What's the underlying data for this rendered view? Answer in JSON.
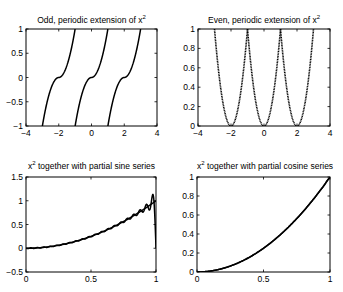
{
  "figure": {
    "background": "#ffffff",
    "line_color": "#000000"
  },
  "chart_data": [
    {
      "type": "line",
      "title": "Odd, periodic extension of x^2",
      "title_text": "Odd, periodic extension of x",
      "title_sup": "2",
      "xlabel": "",
      "ylabel": "",
      "xlim": [
        -4,
        4
      ],
      "ylim": [
        -1,
        1
      ],
      "xticks": [
        "-4",
        "-2",
        "0",
        "2",
        "4"
      ],
      "yticks": [
        "-1",
        "-0.5",
        "0",
        "0.5",
        "1"
      ],
      "grid": false,
      "series": [
        {
          "name": "odd extension",
          "style": "solid",
          "function": "sign(t)*t^2, t = x - 2*round(x/2)",
          "x_range": [
            -3,
            3
          ]
        }
      ]
    },
    {
      "type": "line",
      "title": "Even, periodic extension of x^2",
      "title_text": "Even, periodic extension of x",
      "title_sup": "2",
      "xlabel": "",
      "ylabel": "",
      "xlim": [
        -4,
        4
      ],
      "ylim": [
        0,
        1
      ],
      "xticks": [
        "-4",
        "-2",
        "0",
        "2",
        "4"
      ],
      "yticks": [
        "0",
        "0.2",
        "0.4",
        "0.6",
        "0.8",
        "1"
      ],
      "grid": false,
      "series": [
        {
          "name": "even extension",
          "style": "dotted",
          "function": "t^2, t = x - 2*round(x/2)",
          "x_range": [
            -3,
            3
          ]
        }
      ]
    },
    {
      "type": "line",
      "title": "x^2 together with partial sine series",
      "title_text": " together with partial sine series",
      "title_prefix": "x",
      "title_sup": "2",
      "xlabel": "",
      "ylabel": "",
      "xlim": [
        0,
        1
      ],
      "ylim": [
        -0.5,
        1.5
      ],
      "xticks": [
        "0",
        "0.5",
        "1"
      ],
      "yticks": [
        "-0.5",
        "0",
        "0.5",
        "1",
        "1.5"
      ],
      "grid": false,
      "series": [
        {
          "name": "x^2",
          "style": "solid",
          "x": [
            0,
            0.25,
            0.5,
            0.75,
            1
          ],
          "values": [
            0,
            0.0625,
            0.25,
            0.5625,
            1
          ]
        },
        {
          "name": "partial sine series",
          "style": "solid",
          "note": "oscillates near x=1 (Gibbs), peak ~1.1, drops to 0 at x=1"
        }
      ]
    },
    {
      "type": "line",
      "title": "x^2 together with partial cosine series",
      "title_text": " together with partial cosine series",
      "title_prefix": "x",
      "title_sup": "2",
      "xlabel": "",
      "ylabel": "",
      "xlim": [
        0,
        1
      ],
      "ylim": [
        0,
        1
      ],
      "xticks": [
        "0",
        "0.5",
        "1"
      ],
      "yticks": [
        "0",
        "0.2",
        "0.4",
        "0.6",
        "0.8",
        "1"
      ],
      "grid": false,
      "series": [
        {
          "name": "x^2",
          "style": "solid",
          "x": [
            0,
            0.25,
            0.5,
            0.75,
            1
          ],
          "values": [
            0,
            0.0625,
            0.25,
            0.5625,
            1
          ]
        },
        {
          "name": "partial cosine series",
          "style": "solid",
          "x": [
            0,
            0.25,
            0.5,
            0.75,
            1
          ],
          "values": [
            0,
            0.0625,
            0.25,
            0.5625,
            1
          ]
        }
      ]
    }
  ]
}
